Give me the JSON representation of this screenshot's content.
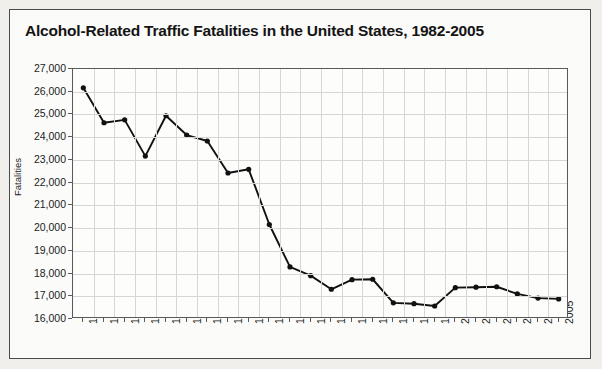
{
  "chart_data": {
    "type": "line",
    "title": "Alcohol-Related Traffic Fatalities in the United States, 1982-2005",
    "xlabel": "",
    "ylabel": "Fatalities",
    "categories": [
      "1982",
      "1983",
      "1984",
      "1985",
      "1986",
      "1987",
      "1988",
      "1989",
      "1990",
      "1991",
      "1992",
      "1993",
      "1994",
      "1995",
      "1996",
      "1997",
      "1998",
      "1999",
      "2000",
      "2001",
      "2002",
      "2003",
      "2004",
      "2005"
    ],
    "values": [
      26173,
      24635,
      24762,
      23167,
      24944,
      24094,
      23833,
      22424,
      22587,
      20159,
      18290,
      17908,
      17308,
      17732,
      17749,
      16711,
      16673,
      16572,
      17380,
      17400,
      17419,
      17105,
      16919,
      16885
    ],
    "ylim": [
      16000,
      27000
    ],
    "ytick_labels": [
      "27,000",
      "26,000",
      "25,000",
      "24,000",
      "23,000",
      "22,000",
      "21,000",
      "20,000",
      "19,000",
      "18,000",
      "17,000",
      "16,000"
    ],
    "ytick_values": [
      27000,
      26000,
      25000,
      24000,
      23000,
      22000,
      21000,
      20000,
      19000,
      18000,
      17000,
      16000
    ],
    "grid": true,
    "legend": "none",
    "series_color": "#111111",
    "marker": "circle"
  },
  "frame": {
    "border_color": "#4a4a4a",
    "background": "#fbfbfa"
  }
}
